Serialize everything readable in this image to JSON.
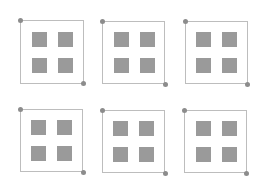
{
  "diagram": {
    "colors": {
      "background": "#ffffff",
      "frame_border": "#bdbdbd",
      "inner_square": "#9a9a9a",
      "handle_dot": "#8c8c8c"
    },
    "frames": [
      {
        "id": 1,
        "row": 1,
        "col": 1,
        "inner_squares": 4
      },
      {
        "id": 2,
        "row": 1,
        "col": 2,
        "inner_squares": 4
      },
      {
        "id": 3,
        "row": 1,
        "col": 3,
        "inner_squares": 4
      },
      {
        "id": 4,
        "row": 2,
        "col": 1,
        "inner_squares": 4
      },
      {
        "id": 5,
        "row": 2,
        "col": 2,
        "inner_squares": 4
      },
      {
        "id": 6,
        "row": 2,
        "col": 3,
        "inner_squares": 4
      }
    ]
  }
}
